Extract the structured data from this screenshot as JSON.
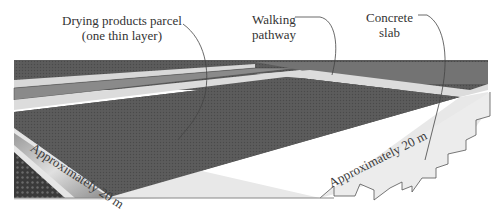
{
  "diagram": {
    "title": "",
    "labels": {
      "parcel_line1": "Drying products parcel",
      "parcel_line2": "(one thin layer)",
      "pathway_line1": "Walking",
      "pathway_line2": "pathway",
      "slab_line1": "Concrete",
      "slab_line2": "slab"
    },
    "dimensions": {
      "left_edge": "Approximately 20 m",
      "right_edge": "Approximately 20 m"
    },
    "colors": {
      "parcel": "#5a5a5a",
      "pathway": "#dcdcdc",
      "slab": "#e8e8e8",
      "far_parcel": "#6a6a6a",
      "strip_mid": "#8c8c8c",
      "leader": "#444444"
    }
  }
}
